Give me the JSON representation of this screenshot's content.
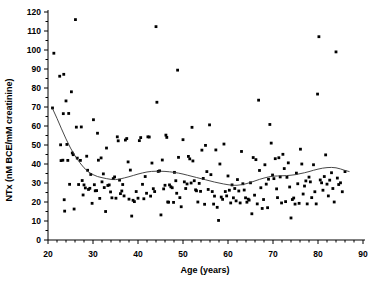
{
  "chart_data": {
    "type": "scatter",
    "title": "",
    "xlabel": "Age  (years)",
    "ylabel": "NTx (nM  BCE/mM  creatinine)",
    "xlim": [
      20,
      90
    ],
    "ylim": [
      0,
      120
    ],
    "xticks": [
      20,
      30,
      40,
      50,
      60,
      70,
      80,
      90
    ],
    "yticks": [
      0,
      10,
      20,
      30,
      40,
      50,
      60,
      70,
      80,
      90,
      100,
      110,
      120
    ],
    "xtick_labels": [
      "20",
      "30",
      "40",
      "50",
      "60",
      "70",
      "80",
      "90"
    ],
    "ytick_labels": [
      "0",
      "10",
      "20",
      "30",
      "40",
      "50",
      "60",
      "70",
      "80",
      "90",
      "100",
      "110",
      "120"
    ],
    "x_minor_tick_interval": 2,
    "grid": false,
    "legend": null,
    "marker": "filled-square",
    "marker_color": "#000000",
    "series": [
      {
        "name": "NTx vs Age",
        "points": [
          [
            21.0,
            69.5
          ],
          [
            21.3,
            98.3
          ],
          [
            22.6,
            86.2
          ],
          [
            22.8,
            50.1
          ],
          [
            22.9,
            41.8
          ],
          [
            23.3,
            42.0
          ],
          [
            23.4,
            66.5
          ],
          [
            23.5,
            87.2
          ],
          [
            23.6,
            21.2
          ],
          [
            23.7,
            15.2
          ],
          [
            24.0,
            73.2
          ],
          [
            24.2,
            50.3
          ],
          [
            24.4,
            41.9
          ],
          [
            24.6,
            66.6
          ],
          [
            24.8,
            29.3
          ],
          [
            25.2,
            78.0
          ],
          [
            25.4,
            45.8
          ],
          [
            25.6,
            44.9
          ],
          [
            25.8,
            16.3
          ],
          [
            26.1,
            116.0
          ],
          [
            26.3,
            59.4
          ],
          [
            26.5,
            43.1
          ],
          [
            26.8,
            29.2
          ],
          [
            27.2,
            41.9
          ],
          [
            27.4,
            59.5
          ],
          [
            27.6,
            31.3
          ],
          [
            27.8,
            23.7
          ],
          [
            28.0,
            29.0
          ],
          [
            28.3,
            27.4
          ],
          [
            28.6,
            44.1
          ],
          [
            28.8,
            36.7
          ],
          [
            29.0,
            26.6
          ],
          [
            29.3,
            27.2
          ],
          [
            29.5,
            34.5
          ],
          [
            29.8,
            19.3
          ],
          [
            30.1,
            63.3
          ],
          [
            30.3,
            29.1
          ],
          [
            30.5,
            25.9
          ],
          [
            30.8,
            26.0
          ],
          [
            31.0,
            56.2
          ],
          [
            31.2,
            42.0
          ],
          [
            31.5,
            21.9
          ],
          [
            31.8,
            43.2
          ],
          [
            32.0,
            30.6
          ],
          [
            32.3,
            34.8
          ],
          [
            32.5,
            27.6
          ],
          [
            32.8,
            15.0
          ],
          [
            33.0,
            48.4
          ],
          [
            33.3,
            28.7
          ],
          [
            33.6,
            29.0
          ],
          [
            33.9,
            25.3
          ],
          [
            34.2,
            22.2
          ],
          [
            34.5,
            32.3
          ],
          [
            34.8,
            33.2
          ],
          [
            35.1,
            22.0
          ],
          [
            35.4,
            54.3
          ],
          [
            35.6,
            52.2
          ],
          [
            35.9,
            31.5
          ],
          [
            36.1,
            24.4
          ],
          [
            36.4,
            25.8
          ],
          [
            36.6,
            29.2
          ],
          [
            36.9,
            23.2
          ],
          [
            37.2,
            52.6
          ],
          [
            37.5,
            53.4
          ],
          [
            37.8,
            41.1
          ],
          [
            38.0,
            21.5
          ],
          [
            38.3,
            36.8
          ],
          [
            38.6,
            12.6
          ],
          [
            38.9,
            20.9
          ],
          [
            39.2,
            20.2
          ],
          [
            39.6,
            25.5
          ],
          [
            40.0,
            22.0
          ],
          [
            40.3,
            52.3
          ],
          [
            40.6,
            53.9
          ],
          [
            41.0,
            29.3
          ],
          [
            41.3,
            21.7
          ],
          [
            41.6,
            33.4
          ],
          [
            41.9,
            24.6
          ],
          [
            42.2,
            54.3
          ],
          [
            42.5,
            54.2
          ],
          [
            42.8,
            23.1
          ],
          [
            43.1,
            40.5
          ],
          [
            43.4,
            27.0
          ],
          [
            43.7,
            25.5
          ],
          [
            44.0,
            112.3
          ],
          [
            44.2,
            72.5
          ],
          [
            44.5,
            36.1
          ],
          [
            44.8,
            36.4
          ],
          [
            45.1,
            13.2
          ],
          [
            45.4,
            42.1
          ],
          [
            45.7,
            26.9
          ],
          [
            46.0,
            28.8
          ],
          [
            46.2,
            55.2
          ],
          [
            46.4,
            54.0
          ],
          [
            46.6,
            20.0
          ],
          [
            46.8,
            19.9
          ],
          [
            47.0,
            29.0
          ],
          [
            47.3,
            28.0
          ],
          [
            47.6,
            27.5
          ],
          [
            47.9,
            19.8
          ],
          [
            48.1,
            35.6
          ],
          [
            48.4,
            31.2
          ],
          [
            48.6,
            24.6
          ],
          [
            48.8,
            89.4
          ],
          [
            49.0,
            43.5
          ],
          [
            49.3,
            22.3
          ],
          [
            49.6,
            17.5
          ],
          [
            50.0,
            52.8
          ],
          [
            50.3,
            30.6
          ],
          [
            50.6,
            27.1
          ],
          [
            50.9,
            29.5
          ],
          [
            51.2,
            44.0
          ],
          [
            51.5,
            42.7
          ],
          [
            51.8,
            30.0
          ],
          [
            52.0,
            59.3
          ],
          [
            52.2,
            41.6
          ],
          [
            52.5,
            31.2
          ],
          [
            52.8,
            26.4
          ],
          [
            53.0,
            25.9
          ],
          [
            53.3,
            20.0
          ],
          [
            53.6,
            29.8
          ],
          [
            53.9,
            25.6
          ],
          [
            54.2,
            47.3
          ],
          [
            54.5,
            32.4
          ],
          [
            54.8,
            18.8
          ],
          [
            55.0,
            49.8
          ],
          [
            55.3,
            36.0
          ],
          [
            55.6,
            26.6
          ],
          [
            55.9,
            60.6
          ],
          [
            56.2,
            34.4
          ],
          [
            56.5,
            25.5
          ],
          [
            56.8,
            18.9
          ],
          [
            57.0,
            23.1
          ],
          [
            57.3,
            47.4
          ],
          [
            57.6,
            17.2
          ],
          [
            57.9,
            10.3
          ],
          [
            58.2,
            40.0
          ],
          [
            58.5,
            22.6
          ],
          [
            58.8,
            21.4
          ],
          [
            59.1,
            50.5
          ],
          [
            59.4,
            25.5
          ],
          [
            59.7,
            23.2
          ],
          [
            60.0,
            33.7
          ],
          [
            60.3,
            26.2
          ],
          [
            60.6,
            19.5
          ],
          [
            60.9,
            29.0
          ],
          [
            61.2,
            22.2
          ],
          [
            61.5,
            27.1
          ],
          [
            61.8,
            20.6
          ],
          [
            62.1,
            31.8
          ],
          [
            62.4,
            25.8
          ],
          [
            62.7,
            19.5
          ],
          [
            63.0,
            46.6
          ],
          [
            63.3,
            29.6
          ],
          [
            63.6,
            26.3
          ],
          [
            63.9,
            22.2
          ],
          [
            64.2,
            19.9
          ],
          [
            64.5,
            21.5
          ],
          [
            64.7,
            21.0
          ],
          [
            65.0,
            30.1
          ],
          [
            65.3,
            13.8
          ],
          [
            65.6,
            43.4
          ],
          [
            65.9,
            23.6
          ],
          [
            66.2,
            42.3
          ],
          [
            66.5,
            19.0
          ],
          [
            66.8,
            73.6
          ],
          [
            67.0,
            36.6
          ],
          [
            67.3,
            27.5
          ],
          [
            67.6,
            16.6
          ],
          [
            67.9,
            21.3
          ],
          [
            68.2,
            39.6
          ],
          [
            68.5,
            29.4
          ],
          [
            68.8,
            17.0
          ],
          [
            69.0,
            32.0
          ],
          [
            69.3,
            60.8
          ],
          [
            69.6,
            51.0
          ],
          [
            69.9,
            34.2
          ],
          [
            70.2,
            32.3
          ],
          [
            70.5,
            42.8
          ],
          [
            70.8,
            26.9
          ],
          [
            71.0,
            22.3
          ],
          [
            71.3,
            43.3
          ],
          [
            71.6,
            33.2
          ],
          [
            71.9,
            19.5
          ],
          [
            72.2,
            45.1
          ],
          [
            72.5,
            37.6
          ],
          [
            72.8,
            20.2
          ],
          [
            73.1,
            33.0
          ],
          [
            73.4,
            40.6
          ],
          [
            73.7,
            27.9
          ],
          [
            74.0,
            11.6
          ],
          [
            74.3,
            21.3
          ],
          [
            74.6,
            22.1
          ],
          [
            74.9,
            18.9
          ],
          [
            75.2,
            35.2
          ],
          [
            75.5,
            29.6
          ],
          [
            75.8,
            19.3
          ],
          [
            76.1,
            47.8
          ],
          [
            76.4,
            40.0
          ],
          [
            76.7,
            24.2
          ],
          [
            77.0,
            28.4
          ],
          [
            77.3,
            31.1
          ],
          [
            77.6,
            19.0
          ],
          [
            78.0,
            33.1
          ],
          [
            78.3,
            30.6
          ],
          [
            78.6,
            22.3
          ],
          [
            79.0,
            39.6
          ],
          [
            79.3,
            25.4
          ],
          [
            79.6,
            19.0
          ],
          [
            79.9,
            76.8
          ],
          [
            80.2,
            107.0
          ],
          [
            80.5,
            31.6
          ],
          [
            80.8,
            30.1
          ],
          [
            81.1,
            26.2
          ],
          [
            81.4,
            33.4
          ],
          [
            81.7,
            44.8
          ],
          [
            82.0,
            29.4
          ],
          [
            82.3,
            23.2
          ],
          [
            82.6,
            31.5
          ],
          [
            83.0,
            35.4
          ],
          [
            83.3,
            27.1
          ],
          [
            83.6,
            20.0
          ],
          [
            84.0,
            99.0
          ],
          [
            84.3,
            32.6
          ],
          [
            84.6,
            29.2
          ],
          [
            85.0,
            30.1
          ],
          [
            85.4,
            25.4
          ],
          [
            86.0,
            36.0
          ]
        ]
      }
    ],
    "fit_curve": {
      "name": "smoothed-trend-line",
      "points": [
        [
          21.0,
          69.2
        ],
        [
          22.0,
          64.0
        ],
        [
          23.0,
          58.5
        ],
        [
          24.0,
          53.2
        ],
        [
          25.0,
          48.4
        ],
        [
          26.0,
          44.3
        ],
        [
          27.0,
          40.9
        ],
        [
          28.0,
          38.0
        ],
        [
          29.0,
          35.8
        ],
        [
          30.0,
          34.4
        ],
        [
          31.0,
          33.4
        ],
        [
          32.0,
          32.8
        ],
        [
          33.0,
          32.3
        ],
        [
          34.0,
          31.9
        ],
        [
          35.0,
          31.8
        ],
        [
          36.0,
          32.1
        ],
        [
          37.0,
          32.7
        ],
        [
          38.0,
          33.3
        ],
        [
          39.0,
          34.0
        ],
        [
          40.0,
          34.7
        ],
        [
          41.0,
          35.3
        ],
        [
          42.0,
          35.8
        ],
        [
          43.0,
          36.1
        ],
        [
          44.0,
          36.2
        ],
        [
          45.0,
          36.2
        ],
        [
          46.0,
          36.1
        ],
        [
          47.0,
          35.9
        ],
        [
          48.0,
          35.6
        ],
        [
          49.0,
          35.2
        ],
        [
          50.0,
          34.7
        ],
        [
          51.0,
          34.1
        ],
        [
          52.0,
          33.5
        ],
        [
          53.0,
          32.9
        ],
        [
          54.0,
          32.3
        ],
        [
          55.0,
          31.7
        ],
        [
          56.0,
          31.1
        ],
        [
          57.0,
          30.5
        ],
        [
          58.0,
          30.0
        ],
        [
          59.0,
          29.5
        ],
        [
          60.0,
          29.1
        ],
        [
          61.0,
          28.8
        ],
        [
          62.0,
          28.8
        ],
        [
          63.0,
          29.1
        ],
        [
          64.0,
          29.6
        ],
        [
          65.0,
          30.3
        ],
        [
          66.0,
          31.1
        ],
        [
          67.0,
          31.9
        ],
        [
          68.0,
          32.6
        ],
        [
          69.0,
          33.2
        ],
        [
          70.0,
          33.6
        ],
        [
          71.0,
          33.7
        ],
        [
          72.0,
          33.8
        ],
        [
          73.0,
          33.9
        ],
        [
          74.0,
          34.1
        ],
        [
          75.0,
          34.4
        ],
        [
          76.0,
          34.9
        ],
        [
          77.0,
          35.4
        ],
        [
          78.0,
          36.0
        ],
        [
          79.0,
          36.7
        ],
        [
          80.0,
          37.3
        ],
        [
          81.0,
          37.8
        ],
        [
          82.0,
          38.1
        ],
        [
          83.0,
          38.2
        ],
        [
          84.0,
          38.0
        ],
        [
          85.0,
          37.4
        ],
        [
          86.0,
          36.6
        ],
        [
          87.0,
          36.0
        ]
      ]
    }
  }
}
